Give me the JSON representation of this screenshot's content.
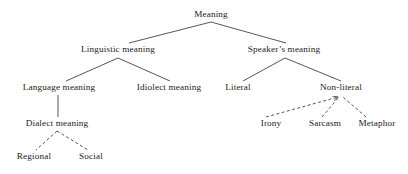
{
  "diagram": {
    "text_color": "#1a1a1a",
    "line_color": "#2b2b2b",
    "background_color": "#ffffff",
    "nodes": [
      {
        "id": "meaning",
        "label": "Meaning",
        "x": 211,
        "y": 15,
        "level": 0
      },
      {
        "id": "linguistic-meaning",
        "label": "Linguistic meaning",
        "x": 118,
        "y": 50,
        "level": 1
      },
      {
        "id": "speakers-meaning",
        "label": "Speaker’s meaning",
        "x": 284,
        "y": 50,
        "level": 1
      },
      {
        "id": "language-meaning",
        "label": "Language meaning",
        "x": 59,
        "y": 88,
        "level": 2
      },
      {
        "id": "idiolect-meaning",
        "label": "Idiolect meaning",
        "x": 169,
        "y": 88,
        "level": 2
      },
      {
        "id": "literal",
        "label": "Literal",
        "x": 238,
        "y": 88,
        "level": 2
      },
      {
        "id": "non-literal",
        "label": "Non-literal",
        "x": 341,
        "y": 88,
        "level": 2
      },
      {
        "id": "dialect-meaning",
        "label": "Dialect meaning",
        "x": 57,
        "y": 124,
        "level": 3
      },
      {
        "id": "irony",
        "label": "Irony",
        "x": 271,
        "y": 124,
        "level": 3
      },
      {
        "id": "sarcasm",
        "label": "Sarcasm",
        "x": 325,
        "y": 124,
        "level": 3
      },
      {
        "id": "metaphor",
        "label": "Metaphor",
        "x": 377,
        "y": 124,
        "level": 3
      },
      {
        "id": "regional",
        "label": "Regional",
        "x": 34,
        "y": 157,
        "level": 4
      },
      {
        "id": "social",
        "label": "Social",
        "x": 91,
        "y": 157,
        "level": 4
      }
    ],
    "edges": [
      {
        "id": "meaning-linguistic",
        "from": "meaning",
        "to": "linguistic-meaning",
        "style": "solid",
        "arrow": false,
        "x1": 211,
        "y1": 22,
        "x2": 129,
        "y2": 43
      },
      {
        "id": "meaning-speakers",
        "from": "meaning",
        "to": "speakers-meaning",
        "style": "solid",
        "arrow": false,
        "x1": 211,
        "y1": 22,
        "x2": 286,
        "y2": 43
      },
      {
        "id": "linguistic-language",
        "from": "linguistic-meaning",
        "to": "language-meaning",
        "style": "solid",
        "arrow": false,
        "x1": 118,
        "y1": 58,
        "x2": 66,
        "y2": 81
      },
      {
        "id": "linguistic-idiolect",
        "from": "linguistic-meaning",
        "to": "idiolect-meaning",
        "style": "solid",
        "arrow": false,
        "x1": 118,
        "y1": 58,
        "x2": 170,
        "y2": 81
      },
      {
        "id": "speakers-literal",
        "from": "speakers-meaning",
        "to": "literal",
        "style": "solid",
        "arrow": false,
        "x1": 285,
        "y1": 58,
        "x2": 243,
        "y2": 81
      },
      {
        "id": "speakers-nonliteral",
        "from": "speakers-meaning",
        "to": "non-literal",
        "style": "solid",
        "arrow": false,
        "x1": 285,
        "y1": 58,
        "x2": 341,
        "y2": 81
      },
      {
        "id": "language-dialect",
        "from": "language-meaning",
        "to": "dialect-meaning",
        "style": "solid",
        "arrow": false,
        "x1": 58,
        "y1": 95,
        "x2": 58,
        "y2": 117
      },
      {
        "id": "dialect-regional",
        "from": "dialect-meaning",
        "to": "regional",
        "style": "dashed",
        "arrow": false,
        "x1": 57,
        "y1": 131,
        "x2": 36,
        "y2": 150
      },
      {
        "id": "dialect-social",
        "from": "dialect-meaning",
        "to": "social",
        "style": "dashed",
        "arrow": false,
        "x1": 57,
        "y1": 131,
        "x2": 88,
        "y2": 150
      },
      {
        "id": "irony-nonliteral",
        "from": "irony",
        "to": "non-literal",
        "style": "dashed",
        "arrow": true,
        "x1": 266,
        "y1": 117,
        "x2": 338,
        "y2": 97
      },
      {
        "id": "sarcasm-nonliteral",
        "from": "sarcasm",
        "to": "non-literal",
        "style": "dashed",
        "arrow": false,
        "x1": 322,
        "y1": 117,
        "x2": 339,
        "y2": 97
      },
      {
        "id": "metaphor-nonliteral",
        "from": "metaphor",
        "to": "non-literal",
        "style": "dashed",
        "arrow": false,
        "x1": 366,
        "y1": 117,
        "x2": 343,
        "y2": 97
      }
    ]
  }
}
